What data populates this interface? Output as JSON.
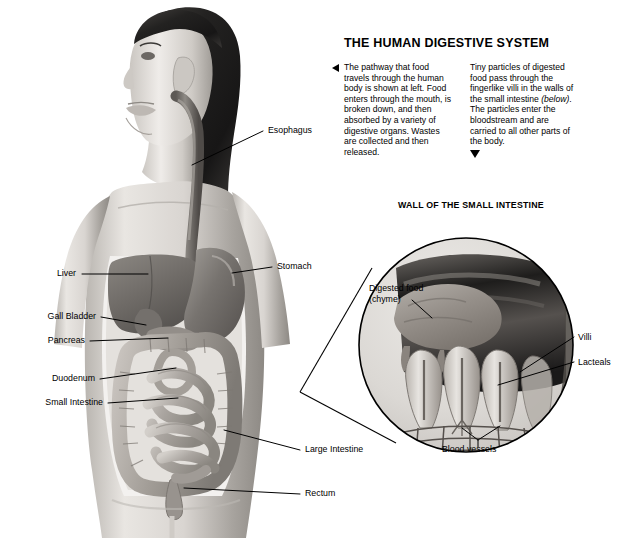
{
  "poster": {
    "headline": "THE HUMAN DIGESTIVE SYSTEM",
    "blurbs": [
      {
        "id": "pathway-blurb",
        "marker": "triangle-left",
        "text": "The pathway that food travels through the human body is shown at left. Food enters through the mouth, is broken down, and then absorbed by a variety of digestive organs. Wastes are collected and then released."
      },
      {
        "id": "villi-blurb",
        "marker": "triangle-down",
        "text_before": "Tiny particles of digested food pass through the fingerlike villi in the walls of the small intestine ",
        "text_italic": "(below)",
        "text_after": ". The particles enter the bloodstream and are carried to all other parts of the body."
      }
    ],
    "inset_title": "WALL OF THE SMALL INTESTINE"
  },
  "body_labels": {
    "esophagus": "Esophagus",
    "stomach": "Stomach",
    "liver": "Liver",
    "gall_bladder": "Gall Bladder",
    "pancreas": "Pancreas",
    "duodenum": "Duodenum",
    "small_intestine": "Small Intestine",
    "large_intestine": "Large Intestine",
    "rectum": "Rectum"
  },
  "inset_labels": {
    "digested_food_line1": "Digested food",
    "digested_food_line2": "(chyme)",
    "villi": "Villi",
    "lacteals": "Lacteals",
    "blood_vessels": "Blood vessels"
  },
  "colors": {
    "background": "#ffffff",
    "text": "#000000",
    "leader_line": "#000000",
    "skin_light": "#e6e3df",
    "skin_mid": "#c9c5c0",
    "skin_shadow": "#9b9791",
    "hair_dark": "#2b2b2b",
    "organ_dark": "#6f6b67",
    "organ_mid": "#9a9591",
    "organ_light": "#c2bdb8",
    "inset_fill": "#d8d5d1",
    "inset_stroke": "#000000"
  }
}
